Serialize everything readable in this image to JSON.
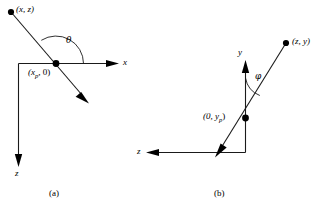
{
  "figure": {
    "background_color": "#ffffff",
    "stroke_color": "#1a1a1a",
    "width": 319,
    "height": 209,
    "panels": [
      {
        "caption": "(a)",
        "point_label": "(x, z)",
        "origin_label_prefix": "(x",
        "origin_label_sub": "p",
        "origin_label_suffix": ", 0)",
        "angle_symbol": "θ",
        "horizontal_axis_label": "x",
        "vertical_axis_label": "z"
      },
      {
        "caption": "(b)",
        "point_label": "(z, y)",
        "origin_label_prefix": "(0, y",
        "origin_label_sub": "p",
        "origin_label_suffix": ")",
        "angle_symbol": "φ",
        "horizontal_axis_label": "z",
        "vertical_axis_label": "y"
      }
    ]
  }
}
